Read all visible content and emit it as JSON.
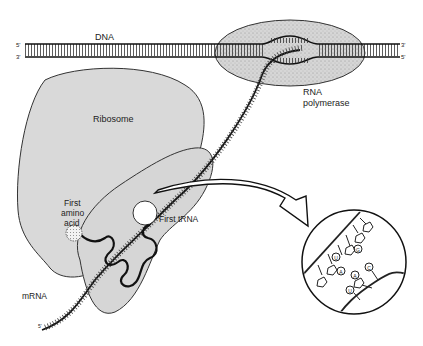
{
  "diagram": {
    "labels": {
      "dna": "DNA",
      "dna_left_top": "5'",
      "dna_left_bottom": "3'",
      "dna_right_top": "3'",
      "dna_right_bottom": "5'",
      "rna_polymerase_line1": "RNA",
      "rna_polymerase_line2": "polymerase",
      "ribosome": "Ribosome",
      "first_amino_line1": "First",
      "first_amino_line2": "amino",
      "first_amino_line3": "acid",
      "first_trna": "First tRNA",
      "mrna": "mRNA",
      "mrna_end": "5'"
    },
    "inset_bases": [
      "A",
      "U",
      "G",
      "A",
      "C",
      "U"
    ],
    "colors": {
      "ribosome_fill": "#d9d9d9",
      "polymerase_fill": "#cfcfcf",
      "stroke": "#1a1a1a",
      "text": "#222222"
    }
  }
}
